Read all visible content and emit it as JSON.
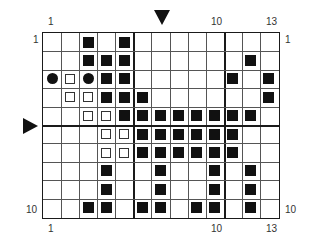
{
  "chart": {
    "columns": 13,
    "rows": 10,
    "labels": {
      "top_left": "1",
      "top_10": "10",
      "top_13": "13",
      "bottom_left": "1",
      "bottom_10": "10",
      "bottom_13": "13",
      "left_row1": "1",
      "left_row10": "10",
      "right_row1": "1",
      "right_row10": "10"
    },
    "markers": {
      "top_arrow_column": 7,
      "side_arrow_between_rows": [
        5,
        6
      ]
    },
    "thick_lines": {
      "after_columns": [
        5,
        10
      ],
      "after_rows": [
        5
      ]
    },
    "symbols": {
      "filled": "filled-square",
      "open": "open-square",
      "dot": "filled-circle"
    },
    "cells": [
      {
        "row": 1,
        "col": 3,
        "type": "filled"
      },
      {
        "row": 1,
        "col": 5,
        "type": "filled"
      },
      {
        "row": 2,
        "col": 3,
        "type": "filled"
      },
      {
        "row": 2,
        "col": 4,
        "type": "filled"
      },
      {
        "row": 2,
        "col": 5,
        "type": "filled"
      },
      {
        "row": 2,
        "col": 12,
        "type": "filled"
      },
      {
        "row": 3,
        "col": 1,
        "type": "dot"
      },
      {
        "row": 3,
        "col": 2,
        "type": "open"
      },
      {
        "row": 3,
        "col": 3,
        "type": "dot"
      },
      {
        "row": 3,
        "col": 4,
        "type": "filled"
      },
      {
        "row": 3,
        "col": 5,
        "type": "filled"
      },
      {
        "row": 3,
        "col": 11,
        "type": "filled"
      },
      {
        "row": 3,
        "col": 13,
        "type": "filled"
      },
      {
        "row": 4,
        "col": 2,
        "type": "open"
      },
      {
        "row": 4,
        "col": 3,
        "type": "open"
      },
      {
        "row": 4,
        "col": 4,
        "type": "filled"
      },
      {
        "row": 4,
        "col": 5,
        "type": "filled"
      },
      {
        "row": 4,
        "col": 6,
        "type": "filled"
      },
      {
        "row": 4,
        "col": 13,
        "type": "filled"
      },
      {
        "row": 5,
        "col": 3,
        "type": "open"
      },
      {
        "row": 5,
        "col": 4,
        "type": "open"
      },
      {
        "row": 5,
        "col": 5,
        "type": "filled"
      },
      {
        "row": 5,
        "col": 6,
        "type": "filled"
      },
      {
        "row": 5,
        "col": 7,
        "type": "filled"
      },
      {
        "row": 5,
        "col": 8,
        "type": "filled"
      },
      {
        "row": 5,
        "col": 9,
        "type": "filled"
      },
      {
        "row": 5,
        "col": 10,
        "type": "filled"
      },
      {
        "row": 5,
        "col": 11,
        "type": "filled"
      },
      {
        "row": 5,
        "col": 12,
        "type": "filled"
      },
      {
        "row": 6,
        "col": 4,
        "type": "open"
      },
      {
        "row": 6,
        "col": 5,
        "type": "open"
      },
      {
        "row": 6,
        "col": 6,
        "type": "filled"
      },
      {
        "row": 6,
        "col": 7,
        "type": "filled"
      },
      {
        "row": 6,
        "col": 8,
        "type": "filled"
      },
      {
        "row": 6,
        "col": 9,
        "type": "filled"
      },
      {
        "row": 6,
        "col": 10,
        "type": "filled"
      },
      {
        "row": 6,
        "col": 11,
        "type": "filled"
      },
      {
        "row": 7,
        "col": 4,
        "type": "open"
      },
      {
        "row": 7,
        "col": 5,
        "type": "open"
      },
      {
        "row": 7,
        "col": 6,
        "type": "filled"
      },
      {
        "row": 7,
        "col": 7,
        "type": "filled"
      },
      {
        "row": 7,
        "col": 8,
        "type": "filled"
      },
      {
        "row": 7,
        "col": 9,
        "type": "filled"
      },
      {
        "row": 7,
        "col": 10,
        "type": "filled"
      },
      {
        "row": 7,
        "col": 11,
        "type": "filled"
      },
      {
        "row": 8,
        "col": 4,
        "type": "filled"
      },
      {
        "row": 8,
        "col": 7,
        "type": "filled"
      },
      {
        "row": 8,
        "col": 10,
        "type": "filled"
      },
      {
        "row": 8,
        "col": 12,
        "type": "filled"
      },
      {
        "row": 9,
        "col": 4,
        "type": "filled"
      },
      {
        "row": 9,
        "col": 7,
        "type": "filled"
      },
      {
        "row": 9,
        "col": 10,
        "type": "filled"
      },
      {
        "row": 9,
        "col": 12,
        "type": "filled"
      },
      {
        "row": 10,
        "col": 3,
        "type": "filled"
      },
      {
        "row": 10,
        "col": 4,
        "type": "filled"
      },
      {
        "row": 10,
        "col": 6,
        "type": "filled"
      },
      {
        "row": 10,
        "col": 7,
        "type": "filled"
      },
      {
        "row": 10,
        "col": 9,
        "type": "filled"
      },
      {
        "row": 10,
        "col": 10,
        "type": "filled"
      },
      {
        "row": 10,
        "col": 12,
        "type": "filled"
      }
    ]
  }
}
